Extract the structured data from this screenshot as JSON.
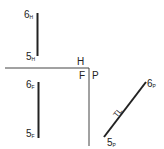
{
  "diagram": {
    "title": "",
    "views": {
      "horizontal": {
        "label": "H",
        "line": {
          "start_label": "6",
          "start_sub": "H",
          "end_label": "5",
          "end_sub": "H"
        }
      },
      "frontal": {
        "label": "F",
        "line": {
          "start_label": "6",
          "start_sub": "F",
          "end_label": "5",
          "end_sub": "F"
        }
      },
      "profile": {
        "label": "P",
        "line": {
          "start_label": "6",
          "start_sub": "P",
          "end_label": "5",
          "end_sub": "P",
          "annotation": "TL"
        }
      }
    },
    "colors": {
      "line": "#222222",
      "fold_line": "#444444"
    }
  }
}
